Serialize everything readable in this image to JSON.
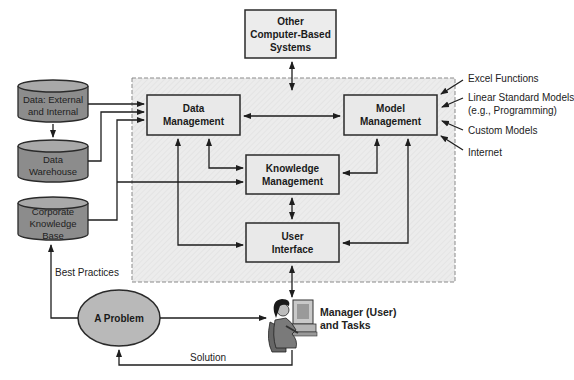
{
  "diagram": {
    "type": "flowchart",
    "colors": {
      "region_fill": "#ebebeb",
      "region_border": "#8a8a8a",
      "box_fill": "#e9e9e9",
      "box_border": "#2a2a2a",
      "cylinder_fill": "#8c8c8c",
      "cylinder_top": "#a9a9a9",
      "ellipse_fill": "#b9b9b9",
      "line": "#1e1e1e"
    },
    "external_system": {
      "line1": "Other",
      "line2": "Computer-Based",
      "line3": "Systems"
    },
    "boxes": {
      "data_management": {
        "line1": "Data",
        "line2": "Management"
      },
      "model_management": {
        "line1": "Model",
        "line2": "Management"
      },
      "knowledge_management": {
        "line1": "Knowledge",
        "line2": "Management"
      },
      "user_interface": {
        "line1": "User",
        "line2": "Interface"
      }
    },
    "data_stores": {
      "external_internal": {
        "line1": "Data: External",
        "line2": "and Internal"
      },
      "warehouse": {
        "line1": "Data",
        "line2": "Warehouse"
      },
      "corporate_kb": {
        "line1": "Corporate",
        "line2": "Knowledge",
        "line3": "Base"
      }
    },
    "model_sources": {
      "excel": "Excel Functions",
      "linear_line1": "Linear Standard Models",
      "linear_line2": "(e.g., Programming)",
      "custom": "Custom Models",
      "internet": "Internet"
    },
    "problem": {
      "label": "A Problem"
    },
    "manager": {
      "line1": "Manager (User)",
      "line2": "and Tasks",
      "icon": "person-at-computer-icon"
    },
    "edge_labels": {
      "best_practices": "Best Practices",
      "solution": "Solution"
    },
    "edges": [
      {
        "from": "Other Computer-Based Systems",
        "to": "Data/Model Management link",
        "dir": "both"
      },
      {
        "from": "Data: External and Internal",
        "to": "Data Management"
      },
      {
        "from": "Data: External and Internal",
        "to": "Data Warehouse"
      },
      {
        "from": "Data Warehouse",
        "to": "Data Management"
      },
      {
        "from": "Corporate Knowledge Base",
        "to": "Data Management"
      },
      {
        "from": "Corporate Knowledge Base",
        "to": "Knowledge Management"
      },
      {
        "from": "Data Management",
        "to": "Model Management",
        "dir": "both"
      },
      {
        "from": "Data Management",
        "to": "Knowledge Management",
        "dir": "both"
      },
      {
        "from": "Data Management",
        "to": "User Interface",
        "dir": "both"
      },
      {
        "from": "Model Management",
        "to": "Knowledge Management",
        "dir": "both"
      },
      {
        "from": "Model Management",
        "to": "User Interface",
        "dir": "both"
      },
      {
        "from": "Knowledge Management",
        "to": "User Interface",
        "dir": "both"
      },
      {
        "from": "User Interface",
        "to": "Manager (User) and Tasks",
        "dir": "both"
      },
      {
        "from": "Excel Functions",
        "to": "Model Management"
      },
      {
        "from": "Linear Standard Models",
        "to": "Model Management"
      },
      {
        "from": "Custom Models",
        "to": "Model Management"
      },
      {
        "from": "Internet",
        "to": "Model Management"
      },
      {
        "from": "A Problem",
        "to": "Manager (User) and Tasks"
      },
      {
        "from": "A Problem",
        "to": "Corporate Knowledge Base",
        "label": "Best Practices"
      },
      {
        "from": "Manager (User) and Tasks",
        "to": "A Problem",
        "label": "Solution"
      }
    ]
  }
}
